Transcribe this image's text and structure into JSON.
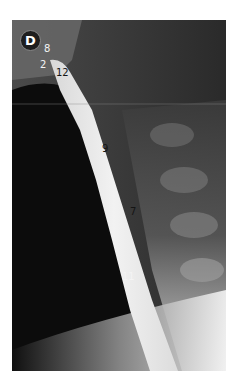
{
  "figure": {
    "panel_label": "D",
    "annotations": [
      {
        "text": "8",
        "color": "white"
      },
      {
        "text": "2",
        "color": "white"
      },
      {
        "text": "12",
        "color": "dark"
      },
      {
        "text": "9",
        "color": "dark"
      },
      {
        "text": "7",
        "color": "dark"
      },
      {
        "text": "11",
        "color": "white"
      }
    ]
  }
}
